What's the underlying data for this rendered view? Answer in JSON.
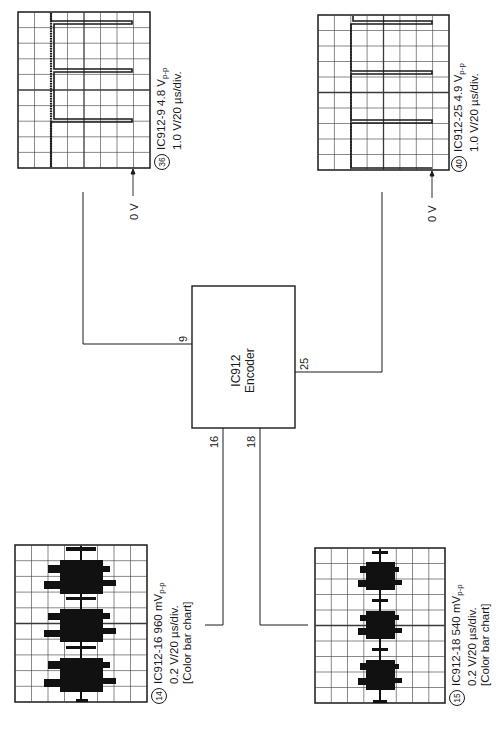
{
  "encoder": {
    "line1": "IC912",
    "line2": "Encoder",
    "pins": {
      "p9": "9",
      "p25": "25",
      "p16": "16",
      "p18": "18"
    }
  },
  "scopes": {
    "s36": {
      "number": "36",
      "title": "IC912-9 4.8 V",
      "title_sub": "p-p",
      "scale": "1.0 V/20 µs/div.",
      "ground_label": "0 V"
    },
    "s40": {
      "number": "40",
      "title": "IC912-25 4.9 V",
      "title_sub": "p-p",
      "scale": "1.0 V/20 µs/div.",
      "ground_label": "0 V"
    },
    "s14": {
      "number": "14",
      "title": "IC912-16 960 mV",
      "title_sub": "p-p",
      "scale": "0.2 V/20 µs/div.",
      "note": "[Color bar chart]"
    },
    "s15": {
      "number": "15",
      "title": "IC912-18 540 mV",
      "title_sub": "p-p",
      "scale": "0.2 V/20 µs/div.",
      "note": "[Color bar chart]"
    }
  },
  "colors": {
    "ink": "#1a1a1a",
    "grid": "#3a3a3a",
    "background": "#ffffff"
  }
}
